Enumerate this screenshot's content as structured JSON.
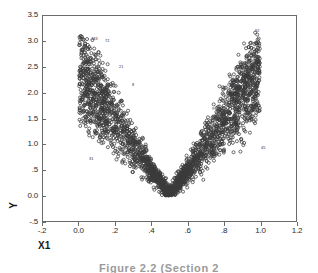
{
  "figure": {
    "caption": "Figure  2.2   (Section  2"
  },
  "axes": {
    "xlabel": "X1",
    "ylabel": "Y",
    "xticks": [
      "-.2",
      "0.0",
      ".2",
      ".4",
      ".6",
      ".8",
      "1.0",
      "1.2"
    ],
    "xtick_values": [
      -0.2,
      0.0,
      0.2,
      0.4,
      0.6,
      0.8,
      1.0,
      1.2
    ],
    "yticks": [
      "3.5",
      "3.0",
      "2.5",
      "2.0",
      "1.5",
      "1.0",
      ".5",
      "0.0",
      "-.5"
    ],
    "ytick_values": [
      3.5,
      3.0,
      2.5,
      2.0,
      1.5,
      1.0,
      0.5,
      0.0,
      -0.5
    ],
    "frame_color": "#6b6b6b"
  },
  "point_labels": [
    {
      "text": "183",
      "x": 0.055,
      "y": 3.02
    },
    {
      "text": "72",
      "x": 0.13,
      "y": 2.97
    },
    {
      "text": "21",
      "x": 0.205,
      "y": 2.47
    },
    {
      "text": "8",
      "x": 0.28,
      "y": 2.12
    },
    {
      "text": "92",
      "x": 0.955,
      "y": 3.17
    },
    {
      "text": "52",
      "x": 0.88,
      "y": 2.55
    },
    {
      "text": "63",
      "x": 0.8,
      "y": 2.13
    },
    {
      "text": "9",
      "x": 0.715,
      "y": 1.66
    },
    {
      "text": "45",
      "x": 0.985,
      "y": 0.92
    },
    {
      "text": "31",
      "x": 0.04,
      "y": 0.7
    }
  ],
  "chart_data": {
    "type": "scatter",
    "title": "",
    "xlabel": "X1",
    "ylabel": "Y",
    "xlim": [
      -0.2,
      1.2
    ],
    "ylim": [
      -0.5,
      3.5
    ],
    "grid": false,
    "legend": null,
    "marker": "open-circle",
    "marker_color": "#3a3a3a",
    "n_points": 2000,
    "relation": "y = a*|x - 0.5| + noise",
    "vertex": [
      0.5,
      0.0
    ],
    "x_range_data": [
      0.0,
      1.0
    ],
    "y_range_data": [
      0.0,
      3.15
    ],
    "arm_slope_abs": 6.2,
    "noise_sd": 0.28,
    "series": [
      {
        "name": "observations",
        "points_summary": {
          "left_arm_x": [
            0.0,
            0.5
          ],
          "left_arm_y": [
            0.0,
            3.1
          ],
          "right_arm_x": [
            0.5,
            1.0
          ],
          "right_arm_y": [
            0.0,
            3.15
          ]
        }
      }
    ]
  }
}
